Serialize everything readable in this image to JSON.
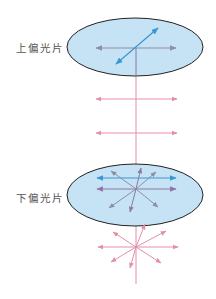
{
  "labels": {
    "upper_polarizer": "上偏光片",
    "lower_polarizer": "下偏光片"
  },
  "colors": {
    "polarizer_fill": "#c6e3f5",
    "polarizer_stroke": "#222222",
    "pink_light": "#e28fa8",
    "purple_arrow": "#8a78a8",
    "blue_arrow": "#3b96d2",
    "gray_arrow": "#8e8ea6"
  }
}
